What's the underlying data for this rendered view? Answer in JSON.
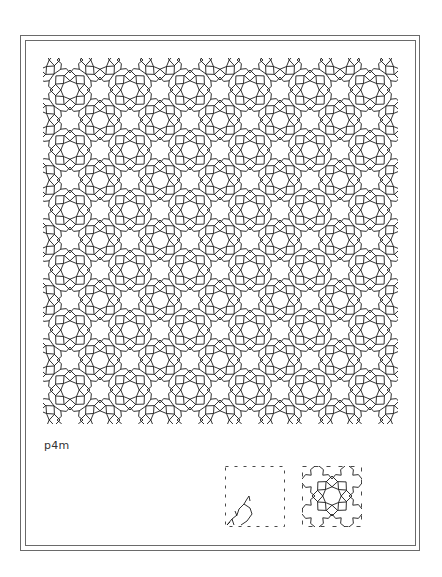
{
  "figure": {
    "group_label": "p4m",
    "pattern": {
      "motif": "8-fold star rosette interlace",
      "period_px": 60,
      "stroke_color": "#1a1a1a",
      "background": "#ffffff"
    },
    "fundamental_region": {
      "caption": "",
      "border_style": "dashed"
    },
    "unit_cell": {
      "caption": "",
      "border_style": "dashed"
    },
    "frame_color": "#6a6a6a"
  }
}
